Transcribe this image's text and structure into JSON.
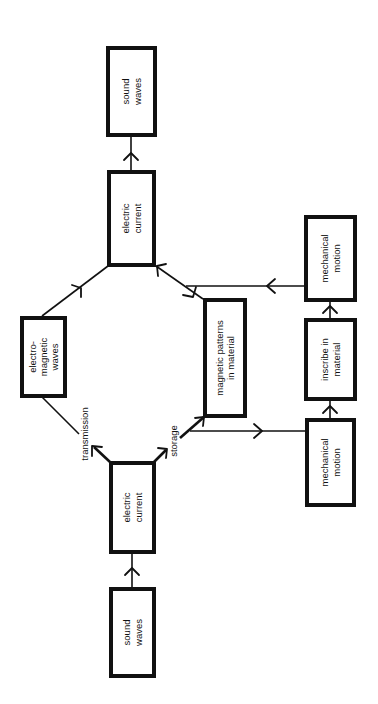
{
  "diagram": {
    "orientation": "rotated -90deg (text reads bottom-to-top)",
    "colors": {
      "stroke": "#111111",
      "background": "#ffffff"
    },
    "nodes": [
      {
        "id": "sound-waves-in",
        "lines": [
          "sound",
          "waves"
        ]
      },
      {
        "id": "electric-current-in",
        "lines": [
          "electric",
          "current"
        ]
      },
      {
        "id": "electromagnetic-waves",
        "lines": [
          "electro-",
          "magnetic",
          "waves"
        ]
      },
      {
        "id": "magnetic-patterns",
        "lines": [
          "magnetic patterns",
          "in material"
        ]
      },
      {
        "id": "mechanical-motion-in",
        "lines": [
          "mechanical",
          "motion"
        ]
      },
      {
        "id": "inscribe-in-material",
        "lines": [
          "inscribe in",
          "material"
        ]
      },
      {
        "id": "mechanical-motion-out",
        "lines": [
          "mechanical",
          "motion"
        ]
      },
      {
        "id": "electric-current-out",
        "lines": [
          "electric",
          "current"
        ]
      },
      {
        "id": "sound-waves-out",
        "lines": [
          "sound",
          "waves"
        ]
      }
    ],
    "edge_labels": {
      "transmission": "transmission",
      "storage": "storage"
    },
    "edges": [
      {
        "from": "sound-waves-in",
        "to": "electric-current-in"
      },
      {
        "from": "electric-current-in",
        "to": "electromagnetic-waves",
        "label": "transmission"
      },
      {
        "from": "electric-current-in",
        "to": "magnetic-patterns",
        "label": "storage"
      },
      {
        "from": "electric-current-in",
        "to": "mechanical-motion-in",
        "label": "storage"
      },
      {
        "from": "mechanical-motion-in",
        "to": "inscribe-in-material"
      },
      {
        "from": "inscribe-in-material",
        "to": "mechanical-motion-out"
      },
      {
        "from": "electromagnetic-waves",
        "to": "electric-current-out"
      },
      {
        "from": "magnetic-patterns",
        "to": "electric-current-out"
      },
      {
        "from": "mechanical-motion-out",
        "to": "electric-current-out"
      },
      {
        "from": "electric-current-out",
        "to": "sound-waves-out"
      }
    ]
  }
}
